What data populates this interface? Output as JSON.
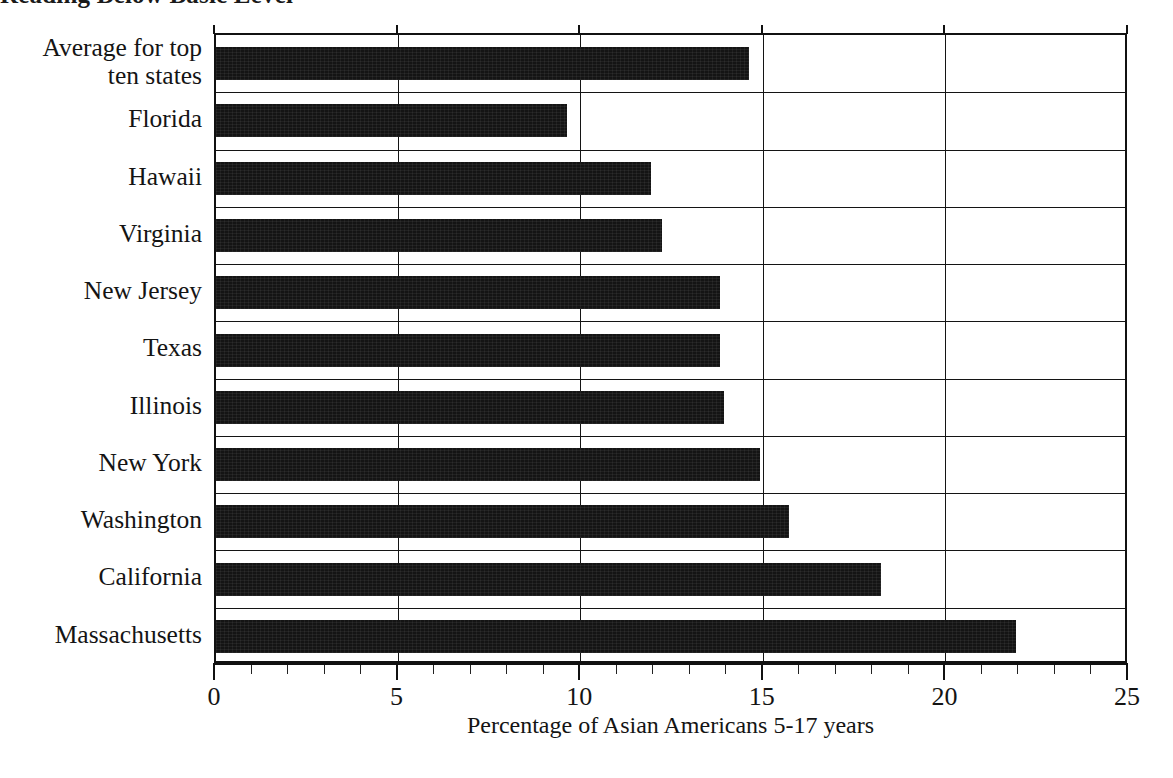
{
  "figure": {
    "title_remnant": "Reading Below Basic Level",
    "axis_title": "Percentage of Asian Americans 5-17 years",
    "bar_color": "#141414",
    "background": "#ffffff"
  },
  "chart_data": {
    "type": "bar",
    "orientation": "horizontal",
    "title": "",
    "xlabel": "Percentage of Asian Americans 5-17 years",
    "ylabel": "",
    "xlim": [
      0,
      25
    ],
    "xticks": [
      0,
      5,
      10,
      15,
      20,
      25
    ],
    "xtick_labels": [
      "0",
      "5",
      "10",
      "15",
      "20",
      "25"
    ],
    "minor_tick_step": 1,
    "grid": "vertical-major",
    "legend": "none",
    "categories": [
      "Average for top ten states",
      "Florida",
      "Hawaii",
      "Virginia",
      "New Jersey",
      "Texas",
      "Illinois",
      "New York",
      "Washington",
      "California",
      "Massachusetts"
    ],
    "values": [
      14.6,
      9.6,
      11.9,
      12.2,
      13.8,
      13.8,
      13.9,
      14.9,
      15.7,
      18.2,
      21.9
    ],
    "series": [
      {
        "name": "Percentage of Asian Americans 5-17 years",
        "values": [
          14.6,
          9.6,
          11.9,
          12.2,
          13.8,
          13.8,
          13.9,
          14.9,
          15.7,
          18.2,
          21.9
        ]
      }
    ]
  },
  "category_label_lines": [
    [
      "Average for top",
      "ten states"
    ],
    [
      "Florida"
    ],
    [
      "Hawaii"
    ],
    [
      "Virginia"
    ],
    [
      "New Jersey"
    ],
    [
      "Texas"
    ],
    [
      "Illinois"
    ],
    [
      "New York"
    ],
    [
      "Washington"
    ],
    [
      "California"
    ],
    [
      "Massachusetts"
    ]
  ]
}
